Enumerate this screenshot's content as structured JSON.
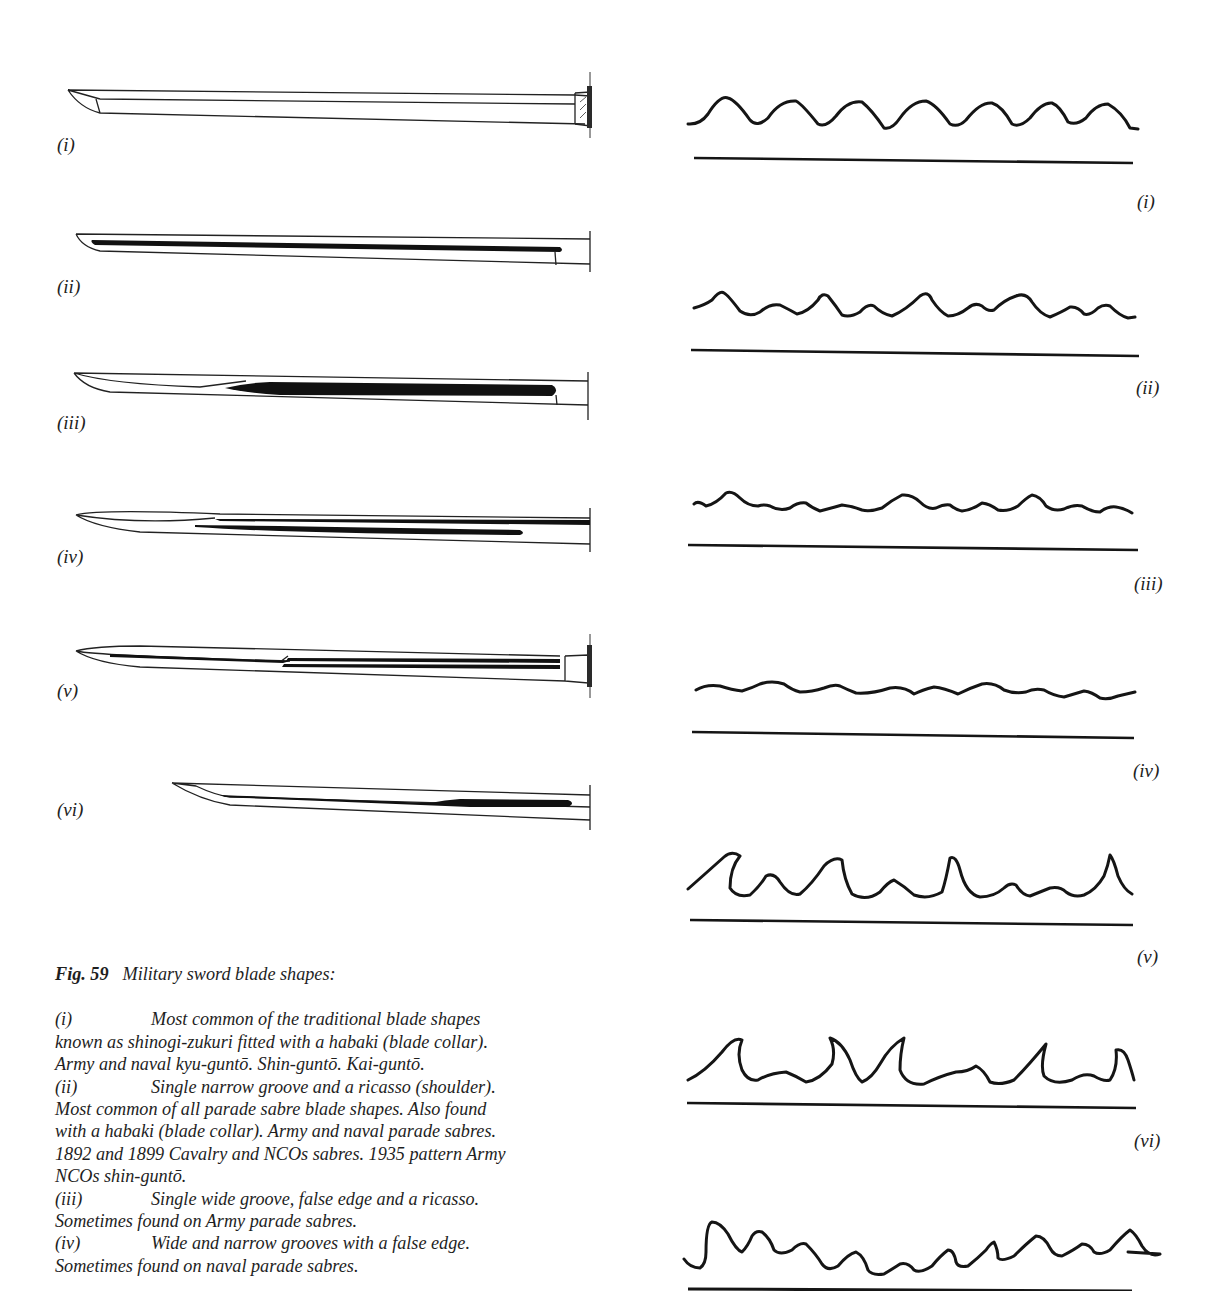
{
  "figure": {
    "number": "Fig. 59",
    "title": "Military sword blade shapes:"
  },
  "blades": [
    {
      "label": "(i)",
      "features": "plain shinogi-zukuri blade with habaki (blade collar)"
    },
    {
      "label": "(ii)",
      "features": "single narrow groove and ricasso"
    },
    {
      "label": "(iii)",
      "features": "single wide groove, false edge and ricasso"
    },
    {
      "label": "(iv)",
      "features": "wide and narrow grooves with false edge"
    },
    {
      "label": "(v)",
      "features": "double grooves with false edge and habaki"
    },
    {
      "label": "(vi)",
      "features": "short blade with groove widening near ricasso"
    }
  ],
  "hamon_patterns": [
    {
      "label": "(i)"
    },
    {
      "label": "(ii)"
    },
    {
      "label": "(iii)"
    },
    {
      "label": "(iv)"
    },
    {
      "label": "(v)"
    },
    {
      "label": "(vi)"
    },
    {
      "label": ""
    }
  ],
  "caption_entries": [
    {
      "num": "(i)",
      "lines": [
        "Most common of the traditional blade shapes",
        "known as shinogi-zukuri fitted with a habaki (blade collar).",
        "Army and naval kyu-guntō. Shin-guntō. Kai-guntō."
      ]
    },
    {
      "num": "(ii)",
      "lines": [
        "Single narrow groove and a ricasso (shoulder).",
        "Most common of all parade sabre blade shapes. Also found",
        "with a habaki (blade collar). Army and naval parade sabres.",
        "1892 and 1899 Cavalry and NCOs sabres. 1935 pattern Army",
        "NCOs shin-guntō."
      ]
    },
    {
      "num": "(iii)",
      "lines": [
        "Single wide groove, false edge and a ricasso.",
        "Sometimes found on Army parade sabres."
      ]
    },
    {
      "num": "(iv)",
      "lines": [
        "Wide and narrow grooves with a false edge.",
        "Sometimes found on naval parade sabres."
      ]
    }
  ],
  "colors": {
    "ink": "#1a1a1a",
    "paper": "#ffffff"
  }
}
